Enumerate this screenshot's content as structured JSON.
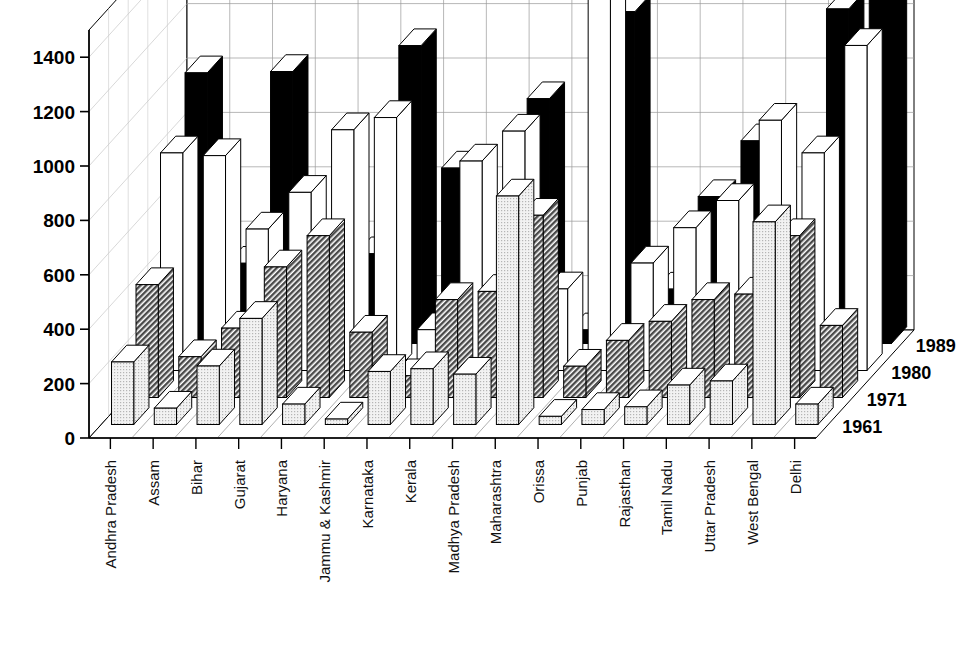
{
  "chart_data": {
    "type": "bar",
    "variant": "3d-grouped-bar",
    "title": "",
    "subtitle": "",
    "xlabel": "",
    "ylabel": "",
    "ylim": [
      0,
      1500
    ],
    "yticks": [
      0,
      200,
      400,
      600,
      800,
      1000,
      1200,
      1400
    ],
    "ytick_labels": [
      "0",
      "200",
      "400",
      "600",
      "800",
      "1000",
      "1200",
      "1400"
    ],
    "grid": true,
    "legend_position": "depth-axis-right",
    "depth_axis_labels": [
      "1961",
      "1971",
      "1980",
      "1989"
    ],
    "categories": [
      "Andhra Pradesh",
      "Assam",
      "Bihar",
      "Gujarat",
      "Haryana",
      "Jammu & Kashmir",
      "Karnataka",
      "Kerala",
      "Madhya Pradesh",
      "Maharashtra",
      "Orissa",
      "Punjab",
      "Rajasthan",
      "Tamil Nadu",
      "Uttar Pradesh",
      "West Bengal",
      "Delhi"
    ],
    "series": [
      {
        "name": "1961",
        "fill": "#e2e2e2",
        "values": [
          230,
          60,
          215,
          390,
          75,
          20,
          195,
          205,
          185,
          840,
          30,
          55,
          65,
          145,
          160,
          745,
          75
        ]
      },
      {
        "name": "1971",
        "fill": "#6b6b6b",
        "values": [
          415,
          150,
          255,
          480,
          595,
          240,
          80,
          360,
          390,
          670,
          115,
          210,
          280,
          360,
          380,
          595,
          265
        ]
      },
      {
        "name": "1980",
        "fill": "#ffffff",
        "values": [
          800,
          790,
          520,
          655,
          885,
          930,
          150,
          770,
          880,
          300,
          1495,
          395,
          525,
          625,
          920,
          800,
          1195
        ]
      },
      {
        "name": "1989",
        "fill": "#000000",
        "values": [
          995,
          295,
          1000,
          260,
          330,
          1095,
          645,
          280,
          900,
          50,
          1220,
          200,
          540,
          745,
          230,
          1230,
          1345
        ]
      }
    ]
  }
}
